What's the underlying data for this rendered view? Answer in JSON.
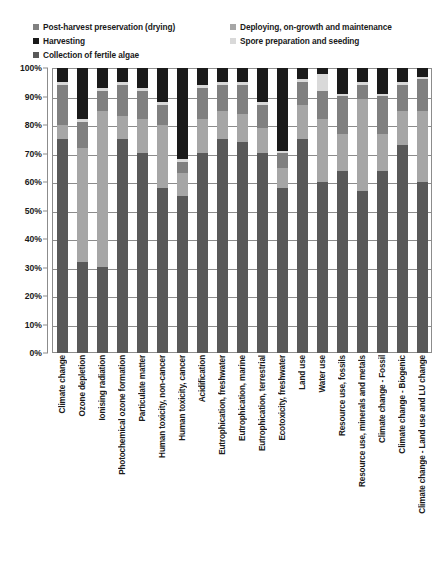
{
  "legend": {
    "columns": [
      [
        {
          "label": "Post-harvest preservation (drying)",
          "color": "#808080",
          "icon": "legend-swatch"
        },
        {
          "label": "Harvesting",
          "color": "#1a1a1a",
          "icon": "legend-swatch"
        },
        {
          "label": "Collection of fertile algae",
          "color": "#595959",
          "icon": "legend-swatch"
        }
      ],
      [
        {
          "label": "Deploying, on-growth and maintenance",
          "color": "#a6a6a6",
          "icon": "legend-swatch"
        },
        {
          "label": "Spore preparation and seeding",
          "color": "#d9d9d9",
          "icon": "legend-swatch"
        }
      ]
    ]
  },
  "chart_data": {
    "type": "bar",
    "subtype": "stacked-100-percent",
    "title": "",
    "xlabel": "",
    "ylabel": "",
    "ylim": [
      0,
      100
    ],
    "ytick_labels": [
      "100%",
      "90%",
      "80%",
      "70%",
      "60%",
      "50%",
      "40%",
      "30%",
      "20%",
      "10%",
      "0%"
    ],
    "ytick_values": [
      100,
      90,
      80,
      70,
      60,
      50,
      40,
      30,
      20,
      10,
      0
    ],
    "grid": true,
    "legend_position": "top",
    "stack_order_top_to_bottom": [
      "Harvesting",
      "Spore preparation and seeding",
      "Post-harvest preservation (drying)",
      "Deploying, on-growth and maintenance",
      "Collection of fertile algae"
    ],
    "colors": {
      "Post-harvest preservation (drying)": "#808080",
      "Harvesting": "#1a1a1a",
      "Collection of fertile algae": "#595959",
      "Deploying, on-growth and maintenance": "#a6a6a6",
      "Spore preparation and seeding": "#d9d9d9"
    },
    "categories": [
      "Climate change",
      "Ozone depletion",
      "Ionising radiation",
      "Photochemical ozone formation",
      "Particulate matter",
      "Human toxicity, non-cancer",
      "Human toxicity, cancer",
      "Acidification",
      "Eutrophication, freshwater",
      "Eutrophication, marine",
      "Eutrophication, terrestrial",
      "Ecotoxicity, freshwater",
      "Land use",
      "Water use",
      "Resource use, fossils",
      "Resource use, minerals and metals",
      "Climate change - Fossil",
      "Climate change - Biogenic",
      "Climate change - Land use and LU change"
    ],
    "series": [
      {
        "name": "Harvesting",
        "color": "#1a1a1a",
        "values": [
          5,
          18,
          7,
          5,
          7,
          12,
          32,
          6,
          5,
          5,
          12,
          29,
          4,
          2,
          9,
          5,
          9,
          5,
          3
        ]
      },
      {
        "name": "Spore preparation and seeding",
        "color": "#d9d9d9",
        "values": [
          1,
          1,
          1,
          1,
          1,
          1,
          1,
          1,
          1,
          1,
          1,
          1,
          1,
          6,
          1,
          1,
          1,
          1,
          1
        ]
      },
      {
        "name": "Post-harvest preservation (drying)",
        "color": "#808080",
        "values": [
          14,
          9,
          7,
          11,
          10,
          7,
          4,
          11,
          9,
          10,
          8,
          5,
          8,
          10,
          13,
          5,
          13,
          9,
          11
        ]
      },
      {
        "name": "Deploying, on-growth and maintenance",
        "color": "#a6a6a6",
        "values": [
          5,
          40,
          55,
          8,
          12,
          22,
          8,
          12,
          10,
          10,
          9,
          7,
          12,
          22,
          13,
          32,
          13,
          12,
          25
        ]
      },
      {
        "name": "Collection of fertile algae",
        "color": "#595959",
        "values": [
          75,
          32,
          30,
          75,
          70,
          58,
          55,
          70,
          75,
          74,
          70,
          58,
          75,
          60,
          64,
          57,
          64,
          73,
          60
        ]
      }
    ]
  }
}
